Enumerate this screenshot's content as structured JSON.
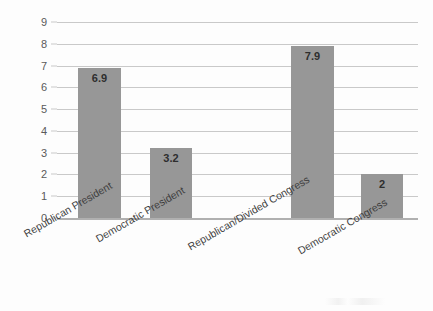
{
  "chart_data": {
    "type": "bar",
    "title": "",
    "xlabel": "",
    "ylabel": "",
    "categories": [
      "Republican President",
      "Democratic President",
      "Republican/Divided Congress",
      "Democratic Congress"
    ],
    "values": [
      6.9,
      3.2,
      7.9,
      2
    ],
    "value_labels": [
      "6.9",
      "3.2",
      "7.9",
      "2"
    ],
    "ylim": [
      0,
      9
    ],
    "y_ticks": [
      "0",
      "1",
      "2",
      "3",
      "4",
      "5",
      "6",
      "7",
      "8",
      "9"
    ],
    "grid": true,
    "legend": "none",
    "series": [
      {
        "name": "",
        "values": [
          6.9,
          3.2,
          7.9,
          2
        ]
      }
    ]
  },
  "style": {
    "bar_color": "#979797",
    "gridline_color": "#c9c9c9",
    "axis_color": "#b0b0b0",
    "tick_label_color": "#5a5a5a",
    "category_label_color": "#3d3d3d",
    "value_label_color": "#2e2e2e",
    "background": "#fdfdfd"
  }
}
